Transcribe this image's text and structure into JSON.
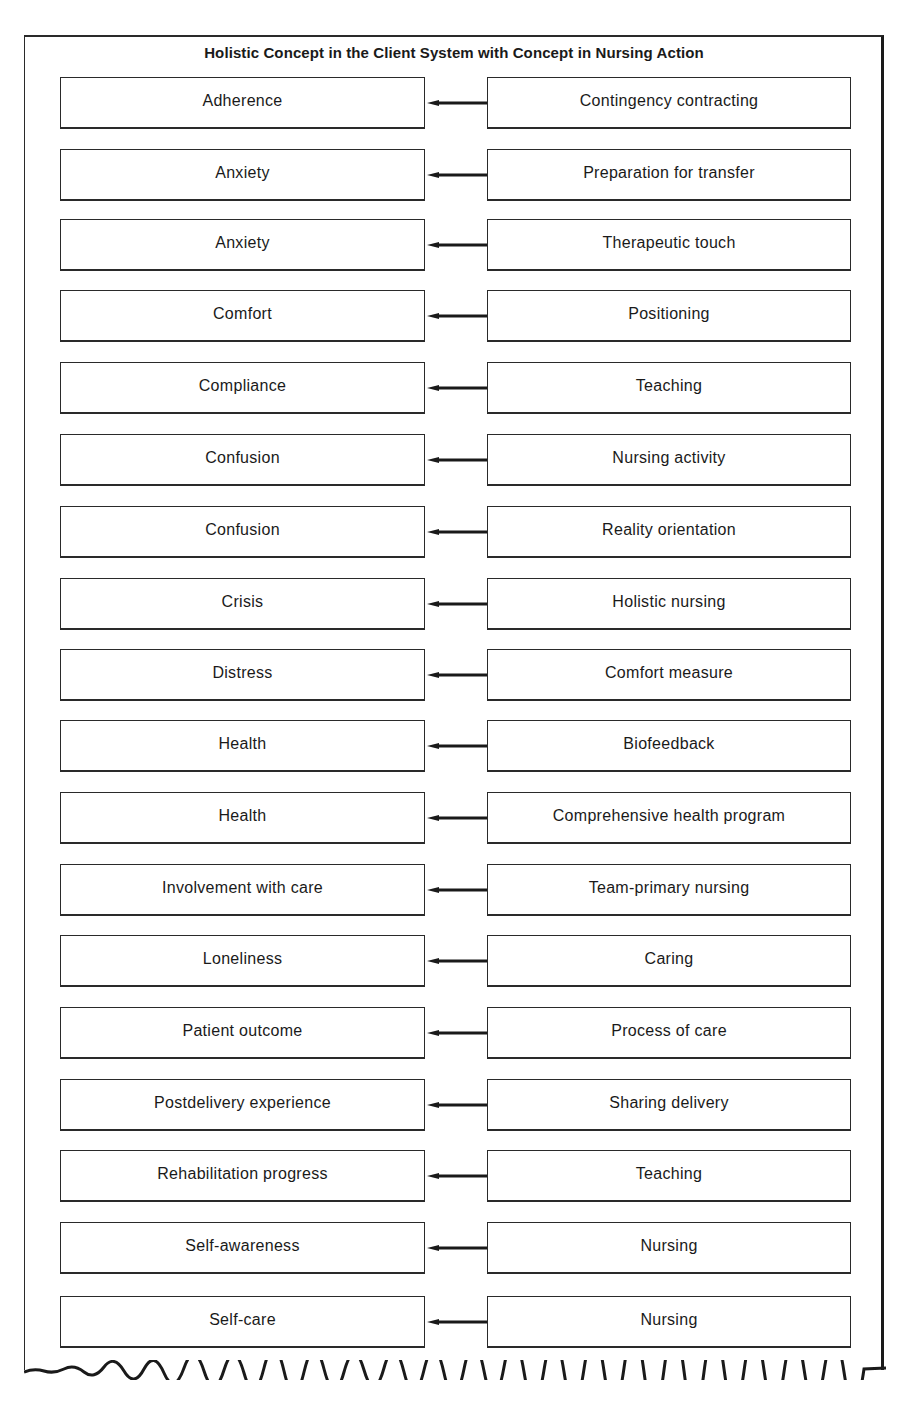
{
  "title": "Holistic Concept in the Client System with Concept in Nursing Action",
  "columns": {
    "left": "Holistic Concept in the Client System",
    "right": "Concept in Nursing Action"
  },
  "rows": [
    {
      "client_concept": "Adherence",
      "nursing_action": "Contingency contracting"
    },
    {
      "client_concept": "Anxiety",
      "nursing_action": "Preparation for transfer"
    },
    {
      "client_concept": "Anxiety",
      "nursing_action": "Therapeutic touch"
    },
    {
      "client_concept": "Comfort",
      "nursing_action": "Positioning"
    },
    {
      "client_concept": "Compliance",
      "nursing_action": "Teaching"
    },
    {
      "client_concept": "Confusion",
      "nursing_action": "Nursing activity"
    },
    {
      "client_concept": "Confusion",
      "nursing_action": "Reality orientation"
    },
    {
      "client_concept": "Crisis",
      "nursing_action": "Holistic nursing"
    },
    {
      "client_concept": "Distress",
      "nursing_action": "Comfort measure"
    },
    {
      "client_concept": "Health",
      "nursing_action": "Biofeedback"
    },
    {
      "client_concept": "Health",
      "nursing_action": "Comprehensive health program"
    },
    {
      "client_concept": "Involvement with care",
      "nursing_action": "Team-primary nursing"
    },
    {
      "client_concept": "Loneliness",
      "nursing_action": "Caring"
    },
    {
      "client_concept": "Patient outcome",
      "nursing_action": "Process of care"
    },
    {
      "client_concept": "Postdelivery experience",
      "nursing_action": "Sharing delivery"
    },
    {
      "client_concept": "Rehabilitation progress",
      "nursing_action": "Teaching"
    },
    {
      "client_concept": "Self-awareness",
      "nursing_action": "Nursing"
    },
    {
      "client_concept": "Self-care",
      "nursing_action": "Nursing"
    }
  ],
  "arrow_direction": "right-to-left",
  "row_tops": [
    77,
    149,
    219,
    290,
    362,
    434,
    506,
    578,
    649,
    720,
    792,
    864,
    935,
    1007,
    1079,
    1150,
    1222,
    1296
  ]
}
